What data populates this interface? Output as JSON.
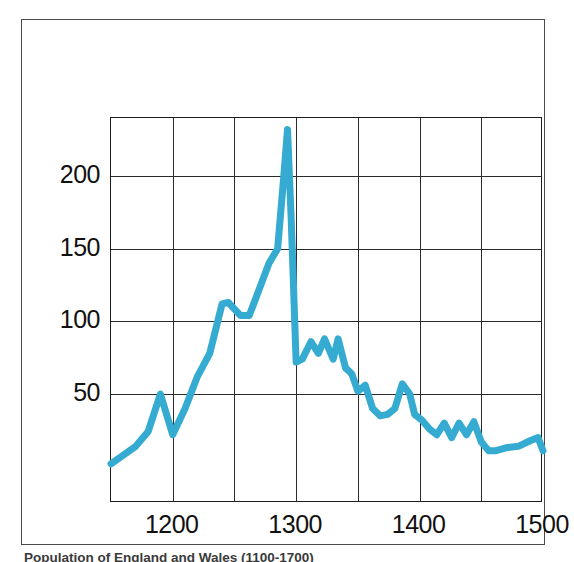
{
  "figure": {
    "caption": "Population of England and Wales (1100-1700)"
  },
  "chart_data": {
    "type": "line",
    "title": "",
    "subtitle": "",
    "xlabel": "",
    "ylabel": "",
    "xlim": [
      1150,
      1500
    ],
    "ylim": [
      -25,
      240
    ],
    "grid": true,
    "grid_x_major": [
      1200,
      1300,
      1400,
      1500
    ],
    "grid_x_minor": [
      1150,
      1250,
      1350,
      1450
    ],
    "grid_y_major": [
      50,
      100,
      150,
      200
    ],
    "legend": "none",
    "legend_position": "none",
    "xticks": [
      "1200",
      "1300",
      "1400",
      "1500"
    ],
    "xtick_values": [
      1200,
      1300,
      1400,
      1500
    ],
    "yticks": [
      "50",
      "100",
      "150",
      "200"
    ],
    "ytick_values": [
      50,
      100,
      150,
      200
    ],
    "line_color": "#35abd2",
    "line_width": 7,
    "series": [
      {
        "name": "series-1",
        "x": [
          1150,
          1160,
          1170,
          1180,
          1190,
          1200,
          1210,
          1220,
          1230,
          1240,
          1245,
          1255,
          1262,
          1270,
          1278,
          1285,
          1290,
          1293,
          1296,
          1300,
          1305,
          1312,
          1318,
          1323,
          1330,
          1334,
          1340,
          1345,
          1350,
          1356,
          1362,
          1368,
          1374,
          1380,
          1386,
          1392,
          1396,
          1402,
          1408,
          1414,
          1420,
          1426,
          1432,
          1438,
          1444,
          1450,
          1456,
          1462,
          1470,
          1480,
          1490,
          1496,
          1500
        ],
        "y": [
          2,
          8,
          14,
          24,
          50,
          22,
          40,
          62,
          78,
          112,
          113,
          104,
          104,
          122,
          140,
          150,
          200,
          232,
          170,
          72,
          74,
          86,
          78,
          88,
          74,
          88,
          68,
          64,
          52,
          56,
          40,
          35,
          36,
          40,
          57,
          50,
          36,
          32,
          26,
          22,
          30,
          20,
          30,
          22,
          31,
          17,
          11,
          11,
          13,
          14,
          18,
          20,
          11
        ]
      }
    ]
  }
}
